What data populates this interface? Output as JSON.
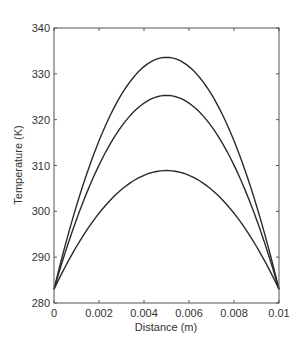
{
  "chart_data": {
    "type": "line",
    "title": "",
    "xlabel": "Distance (m)",
    "ylabel": "Temperature (K)",
    "xlim": [
      0,
      0.01
    ],
    "ylim": [
      280,
      340
    ],
    "xticks": [
      0,
      0.002,
      0.004,
      0.006,
      0.008,
      0.01
    ],
    "xtick_labels": [
      "0",
      "0.002",
      "0.004",
      "0.006",
      "0.008",
      "0.01"
    ],
    "yticks": [
      280,
      290,
      300,
      310,
      320,
      330,
      340
    ],
    "ytick_labels": [
      "280",
      "290",
      "300",
      "310",
      "320",
      "330",
      "340"
    ],
    "grid": false,
    "legend": null,
    "line_color": "#2a2a2a",
    "series": [
      {
        "name": "curve-1",
        "shape": "parabolic",
        "x": [
          0,
          0.001,
          0.002,
          0.003,
          0.004,
          0.005,
          0.006,
          0.007,
          0.008,
          0.009,
          0.01
        ],
        "values": [
          283,
          301.9,
          316.6,
          327.2,
          331.6,
          333.6,
          331.6,
          327.2,
          316.6,
          301.9,
          283
        ]
      },
      {
        "name": "curve-2",
        "shape": "parabolic",
        "x": [
          0,
          0.001,
          0.002,
          0.003,
          0.004,
          0.005,
          0.006,
          0.007,
          0.008,
          0.009,
          0.01
        ],
        "values": [
          283,
          298.2,
          310.1,
          318.5,
          323.7,
          325.3,
          323.7,
          318.5,
          310.1,
          298.2,
          283
        ]
      },
      {
        "name": "curve-3",
        "shape": "parabolic",
        "x": [
          0,
          0.001,
          0.002,
          0.003,
          0.004,
          0.005,
          0.006,
          0.007,
          0.008,
          0.009,
          0.01
        ],
        "values": [
          283,
          292.3,
          299.6,
          304.8,
          307.9,
          308.9,
          307.9,
          304.8,
          299.6,
          292.3,
          283
        ]
      }
    ]
  }
}
